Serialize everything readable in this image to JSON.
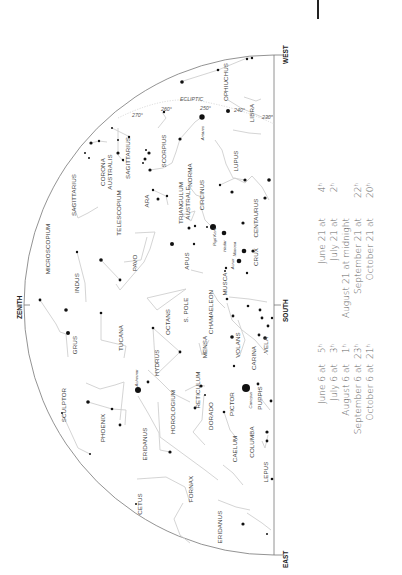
{
  "chart": {
    "edge_labels": {
      "west": "WEST",
      "east": "EAST",
      "south": "SOUTH",
      "zenith": "ZENITH"
    },
    "ecliptic": {
      "label": "ECLIPTIC",
      "degrees": [
        "270°",
        "260°",
        "250°",
        "240°",
        "230°"
      ]
    },
    "constellations": [
      {
        "name": "OPHIUCHUS",
        "x": 228,
        "y": 82
      },
      {
        "name": "LIBRA",
        "x": 254,
        "y": 113
      },
      {
        "name": "SCORPIUS",
        "x": 166,
        "y": 151
      },
      {
        "name": "SAGITTARIUS",
        "x": 130,
        "y": 158
      },
      {
        "name": "CORONA",
        "x": 105,
        "y": 172
      },
      {
        "name": "AUSTRALIS",
        "x": 112,
        "y": 172
      },
      {
        "name": "SAGITTARIUS",
        "x": 76,
        "y": 195
      },
      {
        "name": "LUPUS",
        "x": 238,
        "y": 161
      },
      {
        "name": "NORMA",
        "x": 192,
        "y": 175
      },
      {
        "name": "TELESCOPIUM",
        "x": 121,
        "y": 213
      },
      {
        "name": "ARA",
        "x": 149,
        "y": 201
      },
      {
        "name": "TRIANGULUM",
        "x": 183,
        "y": 203
      },
      {
        "name": "AUSTRALE",
        "x": 190,
        "y": 203
      },
      {
        "name": "CIRCINUS",
        "x": 204,
        "y": 195
      },
      {
        "name": "CENTAURUS",
        "x": 258,
        "y": 218
      },
      {
        "name": "MICROSCOPIUM",
        "x": 50,
        "y": 249
      },
      {
        "name": "PAVO",
        "x": 137,
        "y": 263
      },
      {
        "name": "APUS",
        "x": 189,
        "y": 261
      },
      {
        "name": "CRUX",
        "x": 258,
        "y": 257
      },
      {
        "name": "INDUS",
        "x": 79,
        "y": 283
      },
      {
        "name": "S. POLE",
        "x": 188,
        "y": 310
      },
      {
        "name": "OCTANS",
        "x": 170,
        "y": 322
      },
      {
        "name": "MUSCA",
        "x": 227,
        "y": 284
      },
      {
        "name": "CHAMAELEON",
        "x": 213,
        "y": 312
      },
      {
        "name": "TUCANA",
        "x": 123,
        "y": 338
      },
      {
        "name": "GRUS",
        "x": 77,
        "y": 345
      },
      {
        "name": "HYDRUS",
        "x": 159,
        "y": 363
      },
      {
        "name": "MENSA",
        "x": 207,
        "y": 347
      },
      {
        "name": "VOLANS",
        "x": 240,
        "y": 345
      },
      {
        "name": "CARINA",
        "x": 256,
        "y": 358
      },
      {
        "name": "VELA",
        "x": 268,
        "y": 345
      },
      {
        "name": "SCULPTOR",
        "x": 66,
        "y": 405
      },
      {
        "name": "PHOENIX",
        "x": 105,
        "y": 428
      },
      {
        "name": "HOROLOGIUM",
        "x": 175,
        "y": 412
      },
      {
        "name": "RETICULUM",
        "x": 200,
        "y": 390
      },
      {
        "name": "DORADO",
        "x": 213,
        "y": 416
      },
      {
        "name": "PICTOR",
        "x": 234,
        "y": 404
      },
      {
        "name": "PUPPIS",
        "x": 262,
        "y": 398
      },
      {
        "name": "ERIDANUS",
        "x": 147,
        "y": 444
      },
      {
        "name": "COLUMBA",
        "x": 254,
        "y": 442
      },
      {
        "name": "CAELUM",
        "x": 237,
        "y": 449
      },
      {
        "name": "FORNAX",
        "x": 193,
        "y": 489
      },
      {
        "name": "CETUS",
        "x": 142,
        "y": 504
      },
      {
        "name": "LEPUS",
        "x": 268,
        "y": 472
      },
      {
        "name": "ERIDANUS",
        "x": 222,
        "y": 527
      }
    ],
    "star_names": [
      {
        "name": "Antares",
        "x": 204,
        "y": 133
      },
      {
        "name": "Rigil Kent",
        "x": 216,
        "y": 237
      },
      {
        "name": "Hadar",
        "x": 226,
        "y": 246
      },
      {
        "name": "Mimosa",
        "x": 236,
        "y": 249
      },
      {
        "name": "Acrux",
        "x": 234,
        "y": 264
      },
      {
        "name": "Achernar",
        "x": 138,
        "y": 378
      },
      {
        "name": "Canopus",
        "x": 252,
        "y": 400
      }
    ]
  },
  "side_notes": {
    "block_a": [
      {
        "date": "June 21 at",
        "time": "4",
        "sup": "h"
      },
      {
        "date": "July 21 at",
        "time": "2",
        "sup": "h"
      },
      {
        "date": "August 21 at midnight",
        "time": "",
        "sup": ""
      },
      {
        "date": "September 21 at",
        "time": "22",
        "sup": "h"
      },
      {
        "date": "October 21 at",
        "time": "20",
        "sup": "h"
      }
    ],
    "block_b": [
      {
        "date": "June 6 at",
        "time": "5",
        "sup": "h"
      },
      {
        "date": "July 6 at",
        "time": "3",
        "sup": "h"
      },
      {
        "date": "August 6 at",
        "time": "1",
        "sup": "h"
      },
      {
        "date": "September 6 at",
        "time": "23",
        "sup": "h"
      },
      {
        "date": "October 6 at",
        "time": "21",
        "sup": "h"
      }
    ]
  }
}
